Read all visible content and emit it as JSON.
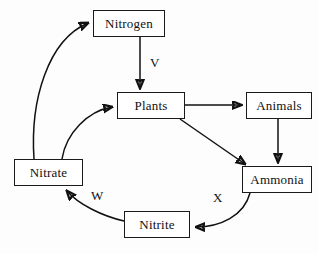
{
  "diagram": {
    "background_color": "#fdfdfd",
    "line_color": "#111111",
    "box_fill": "#ffffff",
    "nodes": [
      {
        "id": "nitrogen",
        "label": "Nitrogen",
        "x": 93,
        "y": 10,
        "w": 72,
        "h": 27
      },
      {
        "id": "plants",
        "label": "Plants",
        "x": 117,
        "y": 92,
        "w": 68,
        "h": 27
      },
      {
        "id": "animals",
        "label": "Animals",
        "x": 246,
        "y": 92,
        "w": 66,
        "h": 27
      },
      {
        "id": "ammonia",
        "label": "Ammonia",
        "x": 242,
        "y": 166,
        "w": 70,
        "h": 27
      },
      {
        "id": "nitrate",
        "label": "Nitrate",
        "x": 14,
        "y": 159,
        "w": 69,
        "h": 27
      },
      {
        "id": "nitrite",
        "label": "Nitrite",
        "x": 124,
        "y": 211,
        "w": 66,
        "h": 27
      }
    ],
    "edge_labels": [
      {
        "id": "v",
        "text": "V",
        "x": 150,
        "y": 55
      },
      {
        "id": "w",
        "text": "W",
        "x": 91,
        "y": 188
      },
      {
        "id": "x",
        "text": "X",
        "x": 213,
        "y": 190
      }
    ],
    "edges": [
      {
        "id": "nitrogen-to-plants",
        "from": "nitrogen",
        "to": "plants",
        "label": "V",
        "style": "straight-vertical"
      },
      {
        "id": "plants-to-animals",
        "from": "plants",
        "to": "animals",
        "label": "",
        "style": "straight-horizontal"
      },
      {
        "id": "animals-to-ammonia",
        "from": "animals",
        "to": "ammonia",
        "label": "",
        "style": "straight-vertical"
      },
      {
        "id": "plants-to-ammonia",
        "from": "plants",
        "to": "ammonia",
        "label": "",
        "style": "straight-diagonal"
      },
      {
        "id": "ammonia-to-nitrite",
        "from": "ammonia",
        "to": "nitrite",
        "label": "X",
        "style": "curved"
      },
      {
        "id": "nitrite-to-nitrate",
        "from": "nitrite",
        "to": "nitrate",
        "label": "W",
        "style": "curved"
      },
      {
        "id": "nitrate-to-plants",
        "from": "nitrate",
        "to": "plants",
        "label": "",
        "style": "curved"
      },
      {
        "id": "nitrate-to-nitrogen",
        "from": "nitrate",
        "to": "nitrogen",
        "label": "",
        "style": "curved"
      }
    ]
  }
}
